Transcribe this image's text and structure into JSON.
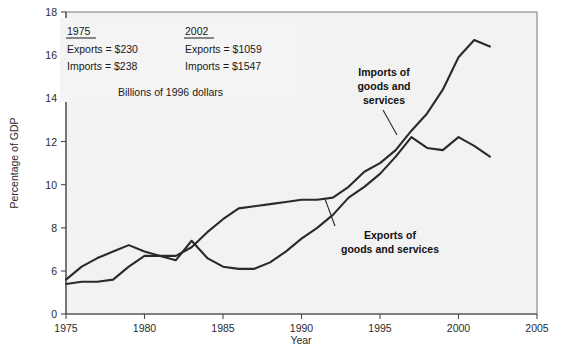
{
  "chart_data": {
    "type": "line",
    "title": "",
    "xlabel": "Year",
    "ylabel": "Percentage of GDP",
    "xlim": [
      1975,
      2005
    ],
    "ylim": [
      5,
      18
    ],
    "y_axis_break_from_zero": true,
    "grid": false,
    "legend": "inline-annotations",
    "xticks": [
      1975,
      1980,
      1985,
      1990,
      1995,
      2000,
      2005
    ],
    "xtick_labels": [
      "1975",
      "1980",
      "1985",
      "1990",
      "1995",
      "2000",
      "2005"
    ],
    "yticks": [
      0,
      6,
      8,
      10,
      12,
      14,
      16,
      18
    ],
    "ytick_labels": [
      "0",
      "6",
      "8",
      "10",
      "12",
      "14",
      "16",
      "18"
    ],
    "x": [
      1975,
      1976,
      1977,
      1978,
      1979,
      1980,
      1981,
      1982,
      1983,
      1984,
      1985,
      1986,
      1987,
      1988,
      1989,
      1990,
      1991,
      1992,
      1993,
      1994,
      1995,
      1996,
      1997,
      1998,
      1999,
      2000,
      2001,
      2002
    ],
    "series": [
      {
        "name": "Exports of goods and services",
        "label_lines": [
          "Exports of",
          "goods and services"
        ],
        "values": [
          5.4,
          5.5,
          5.5,
          5.6,
          6.2,
          6.7,
          6.7,
          6.5,
          7.4,
          6.6,
          6.2,
          6.1,
          6.1,
          6.4,
          6.9,
          7.5,
          8.0,
          8.6,
          9.4,
          9.9,
          10.5,
          11.3,
          12.2,
          11.7,
          11.6,
          12.2,
          11.8,
          11.3
        ]
      },
      {
        "name": "Imports of goods and services",
        "label_lines": [
          "Imports of",
          "goods and",
          "services"
        ],
        "values": [
          5.6,
          6.2,
          6.6,
          6.9,
          7.2,
          6.9,
          6.7,
          6.7,
          7.1,
          7.8,
          8.4,
          8.9,
          9.0,
          9.1,
          9.2,
          9.3,
          9.3,
          9.4,
          9.9,
          10.6,
          11.0,
          11.6,
          12.5,
          13.3,
          14.4,
          15.9,
          16.7,
          16.4
        ]
      }
    ],
    "annotations": [
      {
        "name": "imports-label",
        "text": "Imports of goods and services"
      },
      {
        "name": "exports-label",
        "text": "Exports of goods and services"
      }
    ]
  },
  "infobox": {
    "col1": {
      "year": "1975",
      "exports": "Exports  =  $230",
      "imports": "Imports  =  $238"
    },
    "col2": {
      "year": "2002",
      "exports": "Exports  =  $1059",
      "imports": "Imports  =  $1547"
    },
    "units": "Billions of 1996 dollars"
  }
}
